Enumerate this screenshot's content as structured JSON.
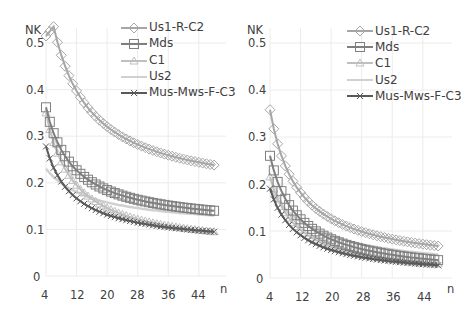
{
  "chart_data": [
    {
      "type": "line",
      "title": "",
      "ylabel": "NK",
      "xlabel": "n",
      "x_ticks": [
        "4",
        "12",
        "20",
        "28",
        "36",
        "44"
      ],
      "y_ticks": [
        "0",
        "0.1",
        "0.2",
        "0.3",
        "0.4",
        "0.5"
      ],
      "ylim": [
        0,
        0.55
      ],
      "xlim": [
        4,
        48
      ],
      "grid": true,
      "legend_position": "top-right",
      "x": [
        4,
        5,
        6,
        7,
        8,
        9,
        10,
        11,
        12,
        13,
        14,
        15,
        16,
        17,
        18,
        19,
        20,
        21,
        22,
        23,
        24,
        25,
        26,
        27,
        28,
        29,
        30,
        31,
        32,
        33,
        34,
        35,
        36,
        37,
        38,
        39,
        40,
        41,
        42,
        43,
        44,
        45,
        46,
        47,
        48
      ],
      "series": [
        {
          "name": "Us1-R-C2",
          "marker": "diamond",
          "color": "#a6a6a6",
          "start": 0.515,
          "peak_n": 6,
          "peak": 0.535,
          "end": 0.238
        },
        {
          "name": "Mds",
          "marker": "square",
          "color": "#7f7f7f",
          "start": 0.362,
          "end": 0.14
        },
        {
          "name": "C1",
          "marker": "triangle",
          "color": "#bfbfbf",
          "start": 0.35,
          "end": 0.095
        },
        {
          "name": "Us2",
          "marker": "none",
          "color": "#d0d0d0",
          "start": 0.23,
          "end": 0.13
        },
        {
          "name": "Mus-Mws-F-C3",
          "marker": "x",
          "color": "#595959",
          "start": 0.278,
          "end": 0.095
        }
      ]
    },
    {
      "type": "line",
      "title": "",
      "ylabel": "NK",
      "xlabel": "n",
      "x_ticks": [
        "4",
        "12",
        "20",
        "28",
        "36",
        "44"
      ],
      "y_ticks": [
        "0",
        "0.1",
        "0.2",
        "0.3",
        "0.4",
        "0.5"
      ],
      "ylim": [
        0,
        0.55
      ],
      "xlim": [
        4,
        48
      ],
      "grid": true,
      "legend_position": "top-right",
      "x": [
        4,
        5,
        6,
        7,
        8,
        9,
        10,
        11,
        12,
        13,
        14,
        15,
        16,
        17,
        18,
        19,
        20,
        21,
        22,
        23,
        24,
        25,
        26,
        27,
        28,
        29,
        30,
        31,
        32,
        33,
        34,
        35,
        36,
        37,
        38,
        39,
        40,
        41,
        42,
        43,
        44,
        45,
        46,
        47,
        48
      ],
      "series": [
        {
          "name": "Us1-R-C2",
          "marker": "diamond",
          "color": "#a6a6a6",
          "start": 0.358,
          "end": 0.068
        },
        {
          "name": "Mds",
          "marker": "square",
          "color": "#7f7f7f",
          "start": 0.26,
          "end": 0.038
        },
        {
          "name": "C1",
          "marker": "triangle",
          "color": "#bfbfbf",
          "start": 0.215,
          "end": 0.03
        },
        {
          "name": "Us2",
          "marker": "none",
          "color": "#d0d0d0",
          "start": 0.19,
          "end": 0.05
        },
        {
          "name": "Mus-Mws-F-C3",
          "marker": "x",
          "color": "#595959",
          "start": 0.19,
          "end": 0.027
        }
      ]
    }
  ],
  "charts": [
    {
      "ylabel": "NK",
      "xlabel": "n",
      "y_ticks": [
        "0.5",
        "0.4",
        "0.3",
        "0.2",
        "0.1",
        "0"
      ],
      "x_ticks": [
        "4",
        "12",
        "20",
        "28",
        "36",
        "44"
      ],
      "legend": [
        "Us1-R-C2",
        "Mds",
        "C1",
        "Us2",
        "Mus-Mws-F-C3"
      ]
    },
    {
      "ylabel": "NK",
      "xlabel": "n",
      "y_ticks": [
        "0.5",
        "0.4",
        "0.3",
        "0.2",
        "0.1",
        "0"
      ],
      "x_ticks": [
        "4",
        "12",
        "20",
        "28",
        "36",
        "44"
      ],
      "legend": [
        "Us1-R-C2",
        "Mds",
        "C1",
        "Us2",
        "Mus-Mws-F-C3"
      ]
    }
  ]
}
